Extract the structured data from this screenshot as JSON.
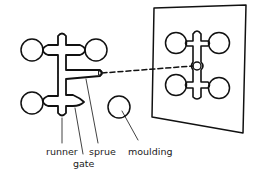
{
  "diagram": {
    "labels": {
      "runner": "runner",
      "gate": "gate",
      "sprue": "sprue",
      "moulding": "moulding"
    },
    "colors": {
      "stroke": "#111111",
      "background": "#ffffff",
      "text": "#222222"
    }
  }
}
